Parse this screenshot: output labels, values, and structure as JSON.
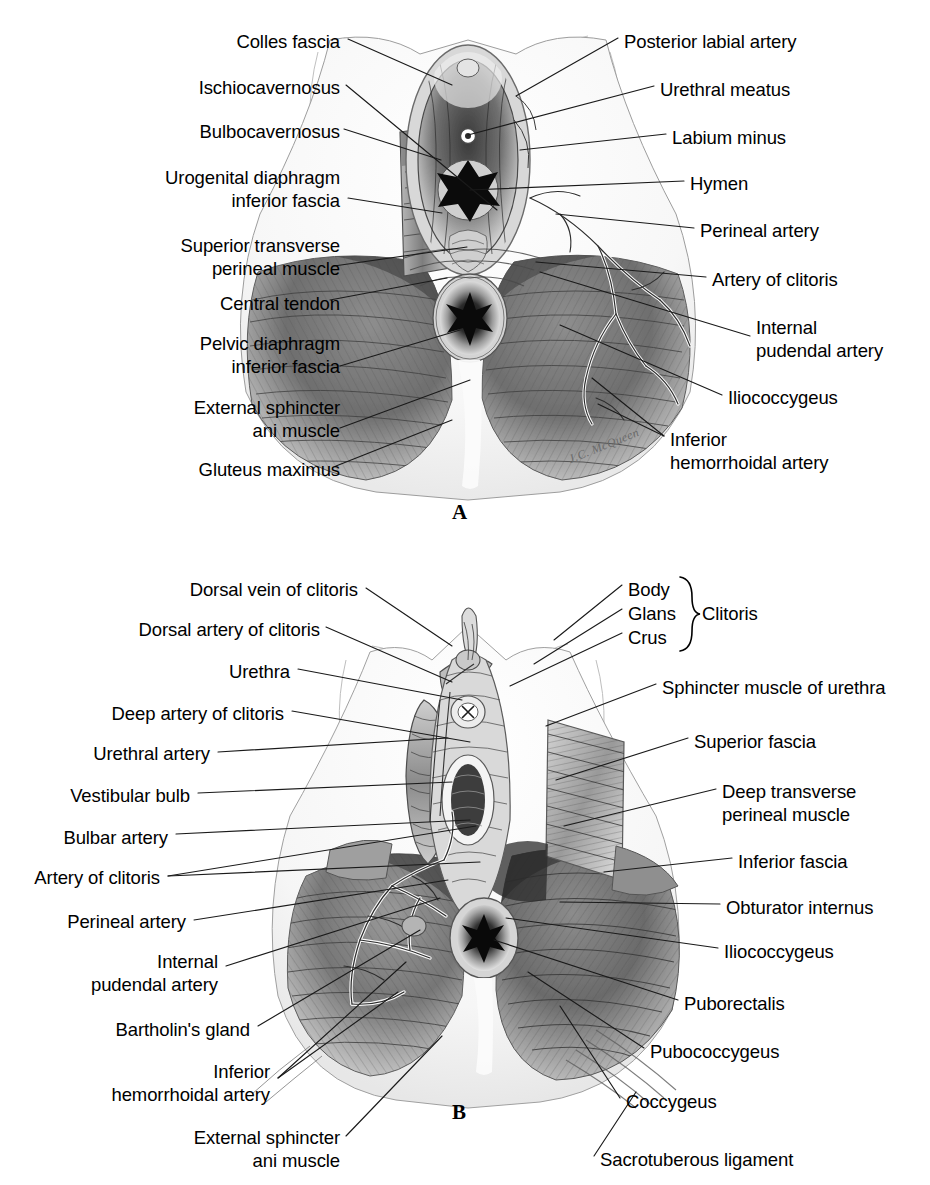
{
  "plate": {
    "width": 930,
    "height": 1185,
    "background": "#ffffff",
    "ink": "#000000",
    "leader_color": "#1a1a1a",
    "signature": "J.C. McQueen"
  },
  "panel_a": {
    "letter": "A",
    "labels_left": [
      {
        "text": "Colles fascia",
        "x": 340,
        "y": 30,
        "align": "right"
      },
      {
        "text": "Ischiocavernosus",
        "x": 340,
        "y": 76,
        "align": "right"
      },
      {
        "text": "Bulbocavernosus",
        "x": 340,
        "y": 120,
        "align": "right"
      },
      {
        "text": "Urogenital diaphragm\ninferior fascia",
        "x": 340,
        "y": 166,
        "align": "right"
      },
      {
        "text": "Superior transverse\nperineal muscle",
        "x": 340,
        "y": 234,
        "align": "right"
      },
      {
        "text": "Central tendon",
        "x": 340,
        "y": 292,
        "align": "right"
      },
      {
        "text": "Pelvic diaphragm\ninferior fascia",
        "x": 340,
        "y": 332,
        "align": "right"
      },
      {
        "text": "External sphincter\nani muscle",
        "x": 340,
        "y": 396,
        "align": "right"
      },
      {
        "text": "Gluteus maximus",
        "x": 340,
        "y": 458,
        "align": "right"
      }
    ],
    "labels_right": [
      {
        "text": "Posterior labial artery",
        "x": 624,
        "y": 30,
        "align": "left"
      },
      {
        "text": "Urethral meatus",
        "x": 660,
        "y": 78,
        "align": "left"
      },
      {
        "text": "Labium minus",
        "x": 672,
        "y": 126,
        "align": "left"
      },
      {
        "text": "Hymen",
        "x": 690,
        "y": 172,
        "align": "left"
      },
      {
        "text": "Perineal artery",
        "x": 700,
        "y": 219,
        "align": "left"
      },
      {
        "text": "Artery of clitoris",
        "x": 712,
        "y": 268,
        "align": "left"
      },
      {
        "text": "Internal\npudendal artery",
        "x": 756,
        "y": 316,
        "align": "left"
      },
      {
        "text": "Iliococcygeus",
        "x": 728,
        "y": 386,
        "align": "left"
      },
      {
        "text": "Inferior\nhemorrhoidal artery",
        "x": 670,
        "y": 428,
        "align": "left"
      }
    ],
    "leaders": [
      {
        "name": "colles-fascia",
        "points": [
          [
            348,
            39
          ],
          [
            452,
            85
          ]
        ]
      },
      {
        "name": "ischiocavernosus",
        "points": [
          [
            346,
            85
          ],
          [
            497,
            210
          ]
        ]
      },
      {
        "name": "bulbocavernosus",
        "points": [
          [
            344,
            129
          ],
          [
            441,
            160
          ]
        ]
      },
      {
        "name": "urogenital-diaphragm-inferior-fascia",
        "points": [
          [
            348,
            198
          ],
          [
            442,
            213
          ]
        ]
      },
      {
        "name": "superior-transverse-perineal-muscle",
        "points": [
          [
            334,
            266
          ],
          [
            467,
            247
          ]
        ]
      },
      {
        "name": "central-tendon",
        "points": [
          [
            330,
            300
          ],
          [
            447,
            278
          ]
        ]
      },
      {
        "name": "pelvic-diaphragm-inferior-fascia",
        "points": [
          [
            340,
            366
          ],
          [
            460,
            330
          ]
        ]
      },
      {
        "name": "external-sphincter-ani-muscle",
        "points": [
          [
            340,
            428
          ],
          [
            470,
            380
          ]
        ]
      },
      {
        "name": "gluteus-maximus",
        "points": [
          [
            336,
            466
          ],
          [
            452,
            420
          ]
        ]
      },
      {
        "name": "posterior-labial-artery",
        "points": [
          [
            618,
            38
          ],
          [
            516,
            96
          ]
        ]
      },
      {
        "name": "urethral-meatus",
        "points": [
          [
            654,
            86
          ],
          [
            468,
            135
          ]
        ]
      },
      {
        "name": "labium-minus",
        "points": [
          [
            666,
            134
          ],
          [
            520,
            150
          ]
        ]
      },
      {
        "name": "hymen",
        "points": [
          [
            684,
            181
          ],
          [
            470,
            190
          ]
        ]
      },
      {
        "name": "perineal-artery",
        "points": [
          [
            694,
            228
          ],
          [
            556,
            214
          ]
        ]
      },
      {
        "name": "artery-of-clitoris",
        "points": [
          [
            706,
            277
          ],
          [
            536,
            262
          ]
        ]
      },
      {
        "name": "internal-pudendal-artery",
        "points": [
          [
            750,
            336
          ],
          [
            540,
            272
          ]
        ]
      },
      {
        "name": "iliococcygeus",
        "points": [
          [
            722,
            395
          ],
          [
            560,
            325
          ]
        ]
      },
      {
        "name": "inferior-hemorrhoidal-artery-1",
        "points": [
          [
            664,
            436
          ],
          [
            598,
            404
          ]
        ]
      },
      {
        "name": "inferior-hemorrhoidal-artery-2",
        "points": [
          [
            664,
            436
          ],
          [
            592,
            378
          ]
        ]
      }
    ]
  },
  "panel_b": {
    "letter": "B",
    "labels_left": [
      {
        "text": "Dorsal vein of clitoris",
        "x": 358,
        "y": 578,
        "align": "right"
      },
      {
        "text": "Dorsal artery of clitoris",
        "x": 320,
        "y": 618,
        "align": "right"
      },
      {
        "text": "Urethra",
        "x": 290,
        "y": 660,
        "align": "right"
      },
      {
        "text": "Deep artery of clitoris",
        "x": 284,
        "y": 702,
        "align": "right"
      },
      {
        "text": "Urethral artery",
        "x": 210,
        "y": 742,
        "align": "right"
      },
      {
        "text": "Vestibular bulb",
        "x": 190,
        "y": 784,
        "align": "right"
      },
      {
        "text": "Bulbar artery",
        "x": 168,
        "y": 826,
        "align": "right"
      },
      {
        "text": "Artery of clitoris",
        "x": 160,
        "y": 866,
        "align": "right"
      },
      {
        "text": "Perineal artery",
        "x": 186,
        "y": 910,
        "align": "right"
      },
      {
        "text": "Internal\npudendal artery",
        "x": 218,
        "y": 950,
        "align": "right"
      },
      {
        "text": "Bartholin's gland",
        "x": 250,
        "y": 1018,
        "align": "right"
      },
      {
        "text": "Inferior\nhemorrhoidal artery",
        "x": 270,
        "y": 1060,
        "align": "right"
      },
      {
        "text": "External sphincter\nani muscle",
        "x": 340,
        "y": 1126,
        "align": "right"
      }
    ],
    "labels_right": [
      {
        "text": "Body",
        "x": 628,
        "y": 578,
        "align": "left"
      },
      {
        "text": "Glans",
        "x": 628,
        "y": 602,
        "align": "left"
      },
      {
        "text": "Crus",
        "x": 628,
        "y": 626,
        "align": "left"
      },
      {
        "text": "Clitoris",
        "x": 702,
        "y": 602,
        "align": "left"
      },
      {
        "text": "Sphincter muscle of urethra",
        "x": 662,
        "y": 676,
        "align": "left"
      },
      {
        "text": "Superior fascia",
        "x": 694,
        "y": 730,
        "align": "left"
      },
      {
        "text": "Deep transverse\nperineal muscle",
        "x": 722,
        "y": 780,
        "align": "left"
      },
      {
        "text": "Inferior fascia",
        "x": 738,
        "y": 850,
        "align": "left"
      },
      {
        "text": "Obturator internus",
        "x": 726,
        "y": 896,
        "align": "left"
      },
      {
        "text": "Iliococcygeus",
        "x": 724,
        "y": 940,
        "align": "left"
      },
      {
        "text": "Puborectalis",
        "x": 684,
        "y": 992,
        "align": "left"
      },
      {
        "text": "Pubococcygeus",
        "x": 650,
        "y": 1040,
        "align": "left"
      },
      {
        "text": "Coccygeus",
        "x": 626,
        "y": 1090,
        "align": "left"
      },
      {
        "text": "Sacrotuberous ligament",
        "x": 600,
        "y": 1148,
        "align": "left"
      }
    ],
    "brace_label": "}",
    "leaders": [
      {
        "name": "dorsal-vein-of-clitoris",
        "points": [
          [
            366,
            588
          ],
          [
            452,
            646
          ]
        ]
      },
      {
        "name": "dorsal-artery-of-clitoris",
        "points": [
          [
            326,
            627
          ],
          [
            452,
            682
          ]
        ]
      },
      {
        "name": "urethra",
        "points": [
          [
            298,
            669
          ],
          [
            462,
            700
          ]
        ]
      },
      {
        "name": "deep-artery-of-clitoris",
        "points": [
          [
            292,
            711
          ],
          [
            470,
            742
          ]
        ]
      },
      {
        "name": "urethral-artery",
        "points": [
          [
            218,
            752
          ],
          [
            448,
            738
          ]
        ]
      },
      {
        "name": "vestibular-bulb",
        "points": [
          [
            198,
            793
          ],
          [
            452,
            782
          ]
        ]
      },
      {
        "name": "bulbar-artery",
        "points": [
          [
            176,
            834
          ],
          [
            470,
            820
          ]
        ]
      },
      {
        "name": "artery-of-clitoris-b1",
        "points": [
          [
            168,
            876
          ],
          [
            476,
            826
          ]
        ]
      },
      {
        "name": "artery-of-clitoris-b2",
        "points": [
          [
            168,
            876
          ],
          [
            480,
            862
          ]
        ]
      },
      {
        "name": "perineal-artery-b",
        "points": [
          [
            194,
            920
          ],
          [
            448,
            880
          ]
        ]
      },
      {
        "name": "internal-pudendal-artery-b",
        "points": [
          [
            226,
            966
          ],
          [
            440,
            898
          ]
        ]
      },
      {
        "name": "bartholins-gland",
        "points": [
          [
            258,
            1026
          ],
          [
            420,
            930
          ]
        ]
      },
      {
        "name": "inferior-hemorrhoidal-artery-b1",
        "points": [
          [
            278,
            1078
          ],
          [
            406,
            962
          ]
        ]
      },
      {
        "name": "inferior-hemorrhoidal-artery-b2",
        "points": [
          [
            278,
            1078
          ],
          [
            398,
            992
          ]
        ]
      },
      {
        "name": "external-sphincter-ani-muscle-b",
        "points": [
          [
            346,
            1136
          ],
          [
            442,
            1036
          ]
        ]
      },
      {
        "name": "body",
        "points": [
          [
            622,
            585
          ],
          [
            554,
            640
          ]
        ]
      },
      {
        "name": "glans",
        "points": [
          [
            622,
            609
          ],
          [
            534,
            664
          ]
        ]
      },
      {
        "name": "crus",
        "points": [
          [
            622,
            633
          ],
          [
            510,
            686
          ]
        ]
      },
      {
        "name": "sphincter-muscle-of-urethra",
        "points": [
          [
            656,
            684
          ],
          [
            546,
            726
          ]
        ]
      },
      {
        "name": "superior-fascia",
        "points": [
          [
            688,
            738
          ],
          [
            556,
            780
          ]
        ]
      },
      {
        "name": "deep-transverse-perineal-muscle",
        "points": [
          [
            716,
            789
          ],
          [
            564,
            826
          ]
        ]
      },
      {
        "name": "inferior-fascia",
        "points": [
          [
            732,
            858
          ],
          [
            604,
            872
          ]
        ]
      },
      {
        "name": "obturator-internus",
        "points": [
          [
            720,
            904
          ],
          [
            560,
            902
          ]
        ]
      },
      {
        "name": "iliococcygeus-b",
        "points": [
          [
            718,
            948
          ],
          [
            506,
            918
          ]
        ]
      },
      {
        "name": "puborectalis",
        "points": [
          [
            678,
            1000
          ],
          [
            494,
            940
          ]
        ]
      },
      {
        "name": "pubococcygeus",
        "points": [
          [
            644,
            1048
          ],
          [
            528,
            972
          ]
        ]
      },
      {
        "name": "coccygeus",
        "points": [
          [
            620,
            1098
          ],
          [
            560,
            1006
          ]
        ]
      },
      {
        "name": "sacrotuberous-ligament",
        "points": [
          [
            594,
            1156
          ],
          [
            636,
            1092
          ]
        ]
      }
    ]
  }
}
